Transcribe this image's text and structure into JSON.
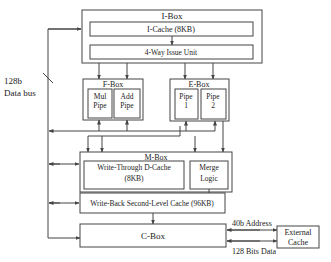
{
  "diagram": {
    "ibox": {
      "title": "I-Box",
      "icache": "I-Cache  (8KB)",
      "issue": "4-Way Issue Unit"
    },
    "fbox": {
      "title": "F-Box",
      "mul": [
        "Mul",
        "Pipe"
      ],
      "add": [
        "Add",
        "Pipe"
      ]
    },
    "ebox": {
      "title": "E-Box",
      "pipe1": [
        "Pipe",
        "1"
      ],
      "pipe2": [
        "Pipe",
        "2"
      ]
    },
    "mbox": {
      "title": "M-Box",
      "dcache": [
        "Write-Through D-Cache",
        "(8KB)"
      ],
      "merge": [
        "Merge",
        "Logic"
      ]
    },
    "l2": {
      "label": "Write-Back Second-Level Cache  (96KB)"
    },
    "cbox": {
      "title": "C-Box"
    },
    "external": {
      "label": [
        "External",
        "Cache"
      ]
    },
    "bus": {
      "width": "128b",
      "label": "Data bus"
    },
    "links": {
      "address": "40b Address",
      "data": "128 Bits Data"
    },
    "colors": {
      "line": "#444444",
      "background": "#ffffff"
    }
  }
}
